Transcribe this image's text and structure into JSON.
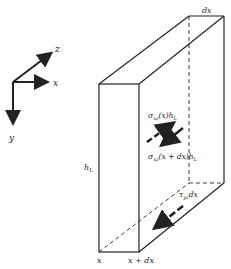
{
  "axes": {
    "x_label": "x",
    "y_label": "y",
    "z_label": "z"
  },
  "block": {
    "top_label": "dx",
    "height_label": "h",
    "height_sub": "L",
    "bottom_left_label": "x",
    "bottom_right_label": "x + dx"
  },
  "forces": {
    "sigma_x": {
      "sym": "σ",
      "sub": "xz",
      "arg": "(x)h",
      "sub2": "L"
    },
    "sigma_xdx": {
      "sym": "σ",
      "sub": "xz",
      "arg": "(x + dx)h",
      "sub2": "L"
    },
    "tau": {
      "sym": "τ",
      "sub": "yz",
      "arg": "dx"
    }
  },
  "colors": {
    "line": "#222222",
    "background": "#ffffff"
  }
}
